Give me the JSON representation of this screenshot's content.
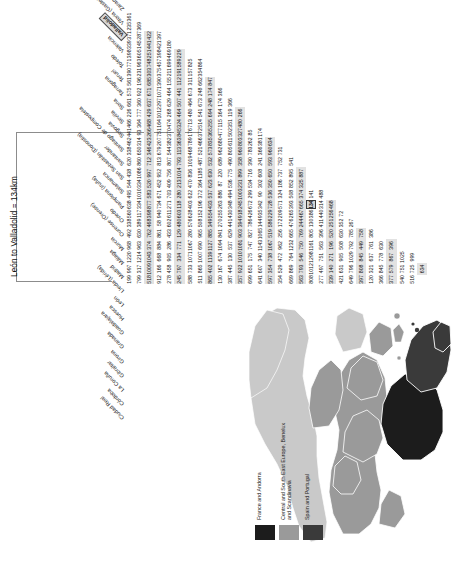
{
  "map": {
    "title_hidden": "",
    "legend": [
      {
        "label": "France and Andorra",
        "color": "#1c1c1c"
      },
      {
        "label": "Central and South East Europe, Benelux and Scandinavia",
        "color": "#9a9a9a"
      },
      {
        "label": "Spain and Portugal",
        "color": "#3a3a3a"
      }
    ]
  },
  "table": {
    "callout": "León to Valladolid = 134km",
    "highlighted_row": "León",
    "highlighted_col": "Valladolid",
    "highlighted_value": "134",
    "columns": [
      "Ciudad Real",
      "Córdoba",
      "La Coruña",
      "Gibraltar",
      "Girona",
      "Granada",
      "Guadalajara",
      "Huesca",
      "León",
      "Lleida (Lérida)",
      "Madrid",
      "Málaga",
      "Murcia",
      "Ourense (Orense)",
      "Oviedo",
      "Pamplona (Iruña)",
      "Salamanca",
      "San Sebastián (Donostia)",
      "Santander",
      "Santiago de Compostela",
      "Segovia",
      "Sevilla",
      "Soria",
      "Tarragona",
      "Teruel",
      "Toledo",
      "Valencia",
      "Valladolid",
      "Vitoria (Gasteiz)",
      "Zaragoza"
    ],
    "rows": [
      [
        "199",
        "997",
        "1220",
        "968",
        "492",
        "338",
        "560",
        "638",
        "495",
        "544",
        "438",
        "620",
        "338",
        "462",
        "441",
        "466",
        "226",
        "661",
        "575",
        "561",
        "390",
        "771",
        "398",
        "339",
        "371",
        "235",
        "361",
        "",
        "",
        ""
      ],
      [
        "799",
        "317",
        "1214",
        "963",
        "630",
        "389",
        "117",
        "334",
        "1010",
        "334",
        "1086",
        "860",
        "650",
        "314",
        "93",
        "364",
        "777",
        "360",
        "922",
        "196",
        "231",
        "963",
        "605",
        "145",
        "287",
        "369",
        "",
        "",
        ""
      ],
      [
        "518",
        "1009",
        "1043",
        "374",
        "762",
        "468",
        "398",
        "877",
        "583",
        "520",
        "997",
        "712",
        "346",
        "423",
        "266",
        "468",
        "429",
        "637",
        "671",
        "685",
        "303",
        "748",
        "251",
        "441",
        "422",
        "",
        "",
        "",
        ""
      ],
      [
        "912",
        "166",
        "668",
        "884",
        "861",
        "58",
        "940",
        "734",
        "671",
        "452",
        "952",
        "813",
        "679",
        "207",
        "751",
        "164",
        "1012",
        "297",
        "1071",
        "390",
        "375",
        "457",
        "398",
        "421",
        "397",
        "",
        "",
        "",
        ""
      ],
      [
        "278",
        "458",
        "905",
        "286",
        "433",
        "602",
        "611",
        "271",
        "703",
        "409",
        "756",
        "807",
        "544",
        "382",
        "370",
        "474",
        "268",
        "629",
        "464",
        "155",
        "211",
        "699",
        "469",
        "180",
        "",
        "",
        "",
        "",
        ""
      ],
      [
        "245",
        "797",
        "334",
        "771",
        "129",
        "480",
        "603",
        "118",
        "280",
        "213",
        "1014",
        "793",
        "113",
        "363",
        "845",
        "324",
        "464",
        "507",
        "441",
        "112",
        "191",
        "589",
        "229",
        "",
        "",
        "",
        "",
        "",
        ""
      ],
      [
        "588",
        "733",
        "1071",
        "1067",
        "280",
        "576",
        "628",
        "403",
        "622",
        "470",
        "836",
        "1019",
        "468",
        "789",
        "176",
        "713",
        "480",
        "464",
        "673",
        "311",
        "157",
        "825",
        "",
        "",
        "",
        "",
        "",
        "",
        ""
      ],
      [
        "511",
        "865",
        "1007",
        "690",
        "965",
        "508",
        "152",
        "196",
        "372",
        "364",
        "1185",
        "487",
        "521",
        "466",
        "372",
        "514",
        "541",
        "673",
        "248",
        "662",
        "354",
        "864",
        "",
        "",
        "",
        "",
        "",
        "",
        ""
      ],
      [
        "865",
        "402",
        "1139",
        "1127",
        "885",
        "349",
        "554",
        "433",
        "537",
        "623",
        "630",
        "532",
        "573",
        "835",
        "365",
        "255",
        "694",
        "248",
        "174",
        "847",
        "",
        "",
        "",
        "",
        "",
        "",
        "",
        "",
        ""
      ],
      [
        "130",
        "167",
        "674",
        "1094",
        "841",
        "270",
        "255",
        "263",
        "886",
        "87",
        "220",
        "689",
        "962",
        "680",
        "477",
        "115",
        "364",
        "174",
        "366",
        "",
        "",
        "",
        "",
        "",
        "",
        "",
        "",
        "",
        ""
      ],
      [
        "387",
        "445",
        "130",
        "537",
        "629",
        "441",
        "430",
        "348",
        "494",
        "536",
        "775",
        "490",
        "805",
        "611",
        "502",
        "351",
        "119",
        "366",
        "",
        "",
        "",
        "",
        "",
        "",
        "",
        "",
        "",
        "",
        ""
      ],
      [
        "357",
        "922",
        "1010",
        "1081",
        "903",
        "394",
        "918",
        "245",
        "1003",
        "231",
        "899",
        "358",
        "960",
        "803",
        "327",
        "480",
        "266",
        "",
        "",
        "",
        "",
        "",
        "",
        "",
        "",
        "",
        "",
        "",
        ""
      ],
      [
        "699",
        "651",
        "175",
        "747",
        "827",
        "786",
        "426",
        "672",
        "299",
        "534",
        "716",
        "390",
        "783",
        "262",
        "85",
        "",
        "",
        "",
        "",
        "",
        "",
        "",
        "",
        "",
        "",
        "",
        "",
        "",
        ""
      ],
      [
        "641",
        "607",
        "340",
        "1143",
        "1065",
        "144",
        "935",
        "342",
        "90",
        "302",
        "608",
        "241",
        "366",
        "381",
        "174",
        "",
        "",
        "",
        "",
        "",
        "",
        "",
        "",
        "",
        "",
        "",
        "",
        "",
        ""
      ],
      [
        "597",
        "354",
        "738",
        "1067",
        "519",
        "586",
        "229",
        "728",
        "536",
        "350",
        "650",
        "593",
        "960",
        "634",
        "",
        "",
        "",
        "",
        "",
        "",
        "",
        "",
        "",
        "",
        "",
        "",
        "",
        "",
        ""
      ],
      [
        "354",
        "529",
        "472",
        "962",
        "256",
        "172",
        "209",
        "571",
        "324",
        "186",
        "737",
        "752",
        "731",
        "",
        "",
        "",
        "",
        "",
        "",
        "",
        "",
        "",
        "",
        "",
        "",
        "",
        "",
        "",
        ""
      ],
      [
        "669",
        "869",
        "764",
        "1232",
        "665",
        "476",
        "265",
        "393",
        "508",
        "852",
        "895",
        "541",
        "",
        "",
        "",
        "",
        "",
        "",
        "",
        "",
        "",
        "",
        "",
        "",
        "",
        "",
        "",
        "",
        ""
      ],
      [
        "563",
        "793",
        "546",
        "750",
        "769",
        "244",
        "467",
        "665",
        "374",
        "325",
        "887",
        "",
        "",
        "",
        "",
        "",
        "",
        "",
        "",
        "",
        "",
        "",
        "",
        "",
        "",
        "",
        "",
        "",
        ""
      ],
      [
        "808",
        "1012",
        "1298",
        "1161",
        "805",
        "130",
        "386",
        "134",
        "141",
        "",
        "",
        "",
        "",
        "",
        "",
        "",
        "",
        "",
        "",
        "",
        "",
        "",
        "",
        "",
        "",
        "",
        "",
        "",
        ""
      ],
      [
        "277",
        "497",
        "751",
        "563",
        "396",
        "411",
        "440",
        "314",
        "488",
        "",
        "",
        "",
        "",
        "",
        "",
        "",
        "",
        "",
        "",
        "",
        "",
        "",
        "",
        "",
        "",
        "",
        "",
        "",
        ""
      ],
      [
        "339",
        "140",
        "271",
        "196",
        "520",
        "251",
        "256",
        "468",
        "",
        "",
        "",
        "",
        "",
        "",
        "",
        "",
        "",
        "",
        "",
        "",
        "",
        "",
        "",
        "",
        "",
        "",
        "",
        "",
        ""
      ],
      [
        "421",
        "631",
        "905",
        "508",
        "630",
        "352",
        "72",
        "",
        "",
        "",
        "",
        "",
        "",
        "",
        "",
        "",
        "",
        "",
        "",
        "",
        "",
        "",
        "",
        "",
        "",
        "",
        "",
        "",
        ""
      ],
      [
        "649",
        "796",
        "1029",
        "792",
        "785",
        "267",
        "",
        "",
        "",
        "",
        "",
        "",
        "",
        "",
        "",
        "",
        "",
        "",
        "",
        "",
        "",
        "",
        "",
        "",
        "",
        "",
        "",
        "",
        ""
      ],
      [
        "397",
        "808",
        "845",
        "449",
        "758",
        "",
        "",
        "",
        "",
        "",
        "",
        "",
        "",
        "",
        "",
        "",
        "",
        "",
        "",
        "",
        "",
        "",
        "",
        "",
        "",
        "",
        "",
        "",
        ""
      ],
      [
        "120",
        "321",
        "637",
        "761",
        "386",
        "",
        "",
        "",
        "",
        "",
        "",
        "",
        "",
        "",
        "",
        "",
        "",
        "",
        "",
        "",
        "",
        "",
        "",
        "",
        "",
        "",
        "",
        "",
        ""
      ],
      [
        "366",
        "845",
        "778",
        "630",
        "",
        "",
        "",
        "",
        "",
        "",
        "",
        "",
        "",
        "",
        "",
        "",
        "",
        "",
        "",
        "",
        "",
        "",
        "",
        "",
        "",
        "",
        "",
        "",
        ""
      ],
      [
        "377",
        "579",
        "867",
        "396",
        "",
        "",
        "",
        "",
        "",
        "",
        "",
        "",
        "",
        "",
        "",
        "",
        "",
        "",
        "",
        "",
        "",
        "",
        "",
        "",
        "",
        "",
        "",
        "",
        ""
      ],
      [
        "540",
        "751",
        "1025",
        "",
        "",
        "",
        "",
        "",
        "",
        "",
        "",
        "",
        "",
        "",
        "",
        "",
        "",
        "",
        "",
        "",
        "",
        "",
        "",
        "",
        "",
        "",
        "",
        "",
        ""
      ],
      [
        "516",
        "725",
        "999",
        "",
        "",
        "",
        "",
        "",
        "",
        "",
        "",
        "",
        "",
        "",
        "",
        "",
        "",
        "",
        "",
        "",
        "",
        "",
        "",
        "",
        "",
        "",
        "",
        "",
        ""
      ],
      [
        "",
        "634",
        "",
        "",
        "",
        "",
        "",
        "",
        "",
        "",
        "",
        "",
        "",
        "",
        "",
        "",
        "",
        "",
        "",
        "",
        "",
        "",
        "",
        "",
        "",
        "",
        "",
        "",
        ""
      ]
    ]
  }
}
